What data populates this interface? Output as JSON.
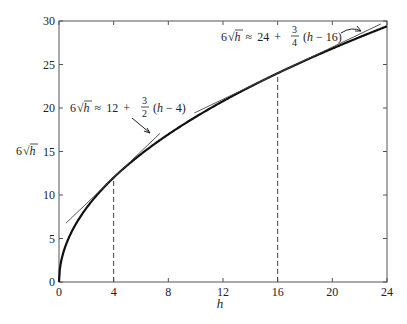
{
  "chart_data": {
    "type": "line",
    "title": "",
    "xlabel": "h",
    "ylabel": "6√h",
    "xlim": [
      0,
      24
    ],
    "ylim": [
      0,
      30
    ],
    "xticks": [
      0,
      4,
      8,
      12,
      16,
      20,
      24
    ],
    "yticks": [
      0,
      5,
      10,
      15,
      20,
      25,
      30
    ],
    "grid": false,
    "legend": null,
    "series": [
      {
        "name": "6√h",
        "function": "6*sqrt(h)",
        "style": "thick solid",
        "x": [
          0,
          0.5,
          1,
          2,
          4,
          6,
          8,
          10,
          12,
          14,
          16,
          18,
          20,
          22,
          24
        ],
        "values": [
          0,
          4.24,
          6,
          8.49,
          12,
          14.7,
          16.97,
          18.97,
          20.78,
          22.45,
          24,
          25.46,
          26.83,
          28.14,
          29.39
        ]
      },
      {
        "name": "tangent at h=4",
        "function": "12 + 3/2 (h - 4)",
        "style": "thin solid",
        "x": [
          0.5,
          7.4
        ],
        "values": [
          6.75,
          17.1
        ]
      },
      {
        "name": "tangent at h=16",
        "function": "24 + 3/4 (h - 16)",
        "style": "thin solid",
        "x": [
          9.9,
          23.55
        ],
        "values": [
          19.43,
          29.66
        ]
      }
    ],
    "reference_lines": [
      {
        "type": "vertical-dashed",
        "x": 4,
        "y_top": 12
      },
      {
        "type": "vertical-dashed",
        "x": 16,
        "y_top": 24
      }
    ],
    "annotations": [
      {
        "id": "ann4",
        "parts": {
          "lhs_coef": "6",
          "lhs_var": "h",
          "approx": "≈",
          "const": "12",
          "plus": "+",
          "num": "3",
          "den": "2",
          "tail_open": "(",
          "tail_var": "h",
          "tail_rest": " − 4)"
        },
        "text": "6√h ≈ 12 + 3/2 (h − 4)",
        "points_to": "tangent at h=4"
      },
      {
        "id": "ann16",
        "parts": {
          "lhs_coef": "6",
          "lhs_var": "h",
          "approx": "≈",
          "const": "24",
          "plus": "+",
          "num": "3",
          "den": "4",
          "tail_open": "(",
          "tail_var": "h",
          "tail_rest": " − 16)"
        },
        "text": "6√h ≈ 24 + 3/4 (h − 16)",
        "points_to": "tangent at h=16"
      }
    ]
  },
  "labels": {
    "x_axis": "h",
    "y_axis_coef": "6",
    "y_axis_var": "h"
  }
}
